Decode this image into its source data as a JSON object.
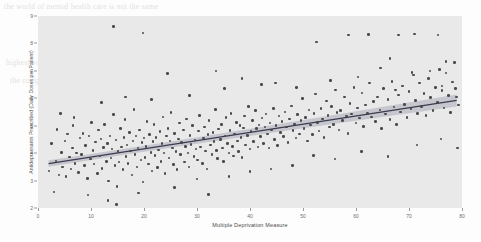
{
  "chart_data": {
    "type": "scatter",
    "title": "",
    "xlabel": "Multiple Deprivation Measure",
    "ylabel": "Antidepressants Prescribed (Daily Doses per Patient)",
    "xlim": [
      0,
      80
    ],
    "ylim": [
      2,
      9
    ],
    "xticks": [
      0,
      10,
      20,
      30,
      40,
      50,
      60,
      70,
      80
    ],
    "yticks": [
      2,
      3,
      4,
      5,
      6,
      7,
      8,
      9
    ],
    "grid": false,
    "legend": null,
    "marker_color": "#4a4a4a",
    "fit_line_color": "#3b3b4f",
    "confidence_band_color": "#b9b9c4",
    "plot_background": "#e9e9e9",
    "fit_line": {
      "type": "linear-regression",
      "x_start": 2.0,
      "y_start": 3.62,
      "x_end": 79.0,
      "y_end": 5.92,
      "slope": 0.0299,
      "intercept": 3.56,
      "confidence_band": {
        "x_start": 2.0,
        "lower_start": 3.5,
        "upper_start": 3.74,
        "x_mid": 26.0,
        "lower_mid": 4.27,
        "upper_mid": 4.42,
        "x_end": 79.0,
        "lower_end": 5.7,
        "upper_end": 6.14
      }
    },
    "points": [
      [
        2.1,
        3.35
      ],
      [
        2.6,
        4.35
      ],
      [
        3.0,
        2.58
      ],
      [
        3.4,
        3.72
      ],
      [
        3.6,
        4.86
      ],
      [
        4.0,
        3.2
      ],
      [
        4.4,
        4.02
      ],
      [
        4.6,
        3.5
      ],
      [
        5.1,
        4.45
      ],
      [
        5.3,
        3.15
      ],
      [
        5.6,
        4.7
      ],
      [
        5.9,
        3.86
      ],
      [
        6.2,
        3.42
      ],
      [
        6.5,
        4.18
      ],
      [
        6.8,
        5.3
      ],
      [
        7.0,
        3.62
      ],
      [
        7.3,
        4.0
      ],
      [
        7.6,
        3.3
      ],
      [
        7.9,
        4.55
      ],
      [
        8.2,
        3.95
      ],
      [
        8.5,
        4.72
      ],
      [
        8.8,
        3.55
      ],
      [
        9.0,
        4.28
      ],
      [
        9.3,
        3.08
      ],
      [
        9.6,
        4.62
      ],
      [
        9.9,
        3.78
      ],
      [
        10.1,
        5.12
      ],
      [
        10.4,
        4.1
      ],
      [
        10.6,
        3.6
      ],
      [
        10.9,
        4.4
      ],
      [
        11.2,
        3.25
      ],
      [
        11.4,
        4.85
      ],
      [
        11.7,
        3.9
      ],
      [
        11.9,
        4.52
      ],
      [
        12.1,
        3.45
      ],
      [
        12.4,
        4.2
      ],
      [
        12.6,
        5.05
      ],
      [
        12.9,
        3.7
      ],
      [
        13.1,
        4.35
      ],
      [
        13.3,
        2.98
      ],
      [
        13.6,
        4.62
      ],
      [
        13.8,
        3.82
      ],
      [
        14.0,
        4.15
      ],
      [
        14.2,
        5.4
      ],
      [
        14.5,
        3.55
      ],
      [
        14.7,
        4.48
      ],
      [
        14.9,
        2.78
      ],
      [
        15.1,
        4.05
      ],
      [
        15.3,
        3.68
      ],
      [
        15.6,
        4.9
      ],
      [
        15.8,
        4.22
      ],
      [
        16.0,
        3.4
      ],
      [
        16.2,
        4.58
      ],
      [
        16.4,
        5.22
      ],
      [
        16.6,
        3.88
      ],
      [
        16.8,
        4.3
      ],
      [
        17.0,
        3.62
      ],
      [
        17.3,
        4.75
      ],
      [
        17.5,
        4.08
      ],
      [
        17.7,
        3.2
      ],
      [
        17.9,
        4.45
      ],
      [
        18.1,
        5.6
      ],
      [
        18.3,
        3.95
      ],
      [
        18.5,
        4.62
      ],
      [
        18.7,
        3.5
      ],
      [
        18.9,
        4.18
      ],
      [
        19.1,
        4.85
      ],
      [
        19.4,
        3.75
      ],
      [
        19.6,
        4.38
      ],
      [
        19.8,
        2.95
      ],
      [
        20.0,
        4.55
      ],
      [
        20.2,
        3.85
      ],
      [
        20.4,
        4.25
      ],
      [
        20.6,
        5.15
      ],
      [
        20.8,
        3.6
      ],
      [
        21.0,
        4.68
      ],
      [
        21.3,
        4.02
      ],
      [
        21.5,
        3.35
      ],
      [
        21.7,
        4.42
      ],
      [
        21.9,
        5.05
      ],
      [
        22.1,
        3.92
      ],
      [
        22.3,
        4.58
      ],
      [
        22.5,
        3.48
      ],
      [
        22.7,
        4.12
      ],
      [
        23.0,
        4.78
      ],
      [
        23.2,
        3.7
      ],
      [
        23.4,
        4.35
      ],
      [
        23.6,
        5.32
      ],
      [
        23.8,
        4.0
      ],
      [
        24.0,
        3.25
      ],
      [
        24.3,
        4.62
      ],
      [
        24.5,
        4.9
      ],
      [
        24.7,
        3.82
      ],
      [
        24.9,
        4.45
      ],
      [
        25.1,
        5.48
      ],
      [
        25.4,
        4.18
      ],
      [
        25.6,
        3.58
      ],
      [
        25.8,
        4.72
      ],
      [
        26.0,
        4.05
      ],
      [
        26.2,
        3.4
      ],
      [
        26.5,
        4.52
      ],
      [
        26.7,
        5.1
      ],
      [
        26.9,
        3.95
      ],
      [
        27.1,
        4.38
      ],
      [
        27.4,
        4.85
      ],
      [
        27.6,
        3.68
      ],
      [
        27.8,
        4.25
      ],
      [
        28.0,
        5.25
      ],
      [
        28.3,
        4.0
      ],
      [
        28.5,
        3.5
      ],
      [
        28.7,
        4.65
      ],
      [
        28.9,
        4.32
      ],
      [
        29.2,
        5.0
      ],
      [
        29.4,
        3.88
      ],
      [
        29.6,
        4.48
      ],
      [
        29.8,
        4.15
      ],
      [
        30.1,
        3.75
      ],
      [
        30.3,
        4.8
      ],
      [
        30.5,
        5.38
      ],
      [
        30.7,
        4.22
      ],
      [
        31.0,
        3.62
      ],
      [
        31.2,
        4.55
      ],
      [
        31.4,
        4.95
      ],
      [
        31.6,
        4.08
      ],
      [
        31.9,
        3.42
      ],
      [
        32.1,
        4.68
      ],
      [
        32.3,
        5.2
      ],
      [
        32.5,
        4.3
      ],
      [
        32.8,
        3.95
      ],
      [
        33.0,
        4.75
      ],
      [
        33.2,
        4.42
      ],
      [
        33.5,
        5.6
      ],
      [
        33.7,
        4.1
      ],
      [
        33.9,
        3.8
      ],
      [
        34.1,
        4.88
      ],
      [
        34.4,
        4.5
      ],
      [
        34.6,
        5.05
      ],
      [
        34.8,
        4.18
      ],
      [
        35.0,
        3.7
      ],
      [
        35.3,
        4.62
      ],
      [
        35.5,
        5.3
      ],
      [
        35.7,
        4.35
      ],
      [
        36.0,
        4.0
      ],
      [
        36.2,
        4.82
      ],
      [
        36.4,
        5.45
      ],
      [
        36.7,
        4.25
      ],
      [
        36.9,
        3.9
      ],
      [
        37.1,
        4.7
      ],
      [
        37.4,
        5.12
      ],
      [
        37.6,
        4.45
      ],
      [
        37.8,
        4.05
      ],
      [
        38.1,
        5.0
      ],
      [
        38.3,
        4.58
      ],
      [
        38.5,
        3.85
      ],
      [
        38.8,
        4.92
      ],
      [
        39.0,
        5.35
      ],
      [
        39.2,
        4.3
      ],
      [
        39.5,
        4.65
      ],
      [
        39.7,
        5.7
      ],
      [
        40.0,
        4.15
      ],
      [
        40.2,
        4.78
      ],
      [
        40.5,
        5.18
      ],
      [
        40.7,
        4.42
      ],
      [
        41.0,
        5.55
      ],
      [
        41.2,
        4.9
      ],
      [
        41.5,
        4.22
      ],
      [
        41.7,
        5.02
      ],
      [
        42.0,
        4.6
      ],
      [
        42.3,
        5.28
      ],
      [
        42.5,
        4.35
      ],
      [
        42.8,
        4.95
      ],
      [
        43.0,
        5.42
      ],
      [
        43.3,
        4.7
      ],
      [
        43.6,
        4.18
      ],
      [
        43.8,
        5.1
      ],
      [
        44.1,
        4.85
      ],
      [
        44.4,
        5.62
      ],
      [
        44.6,
        4.5
      ],
      [
        44.9,
        5.0
      ],
      [
        45.2,
        4.28
      ],
      [
        45.5,
        5.35
      ],
      [
        45.7,
        4.75
      ],
      [
        46.0,
        5.15
      ],
      [
        46.3,
        4.6
      ],
      [
        46.6,
        5.5
      ],
      [
        46.9,
        4.95
      ],
      [
        47.2,
        4.38
      ],
      [
        47.5,
        5.25
      ],
      [
        47.8,
        5.72
      ],
      [
        48.1,
        4.82
      ],
      [
        48.4,
        5.05
      ],
      [
        48.7,
        4.55
      ],
      [
        49.0,
        5.4
      ],
      [
        49.3,
        4.7
      ],
      [
        49.6,
        5.18
      ],
      [
        49.9,
        6.0
      ],
      [
        50.2,
        4.9
      ],
      [
        50.5,
        5.3
      ],
      [
        50.8,
        4.45
      ],
      [
        51.1,
        5.58
      ],
      [
        51.4,
        5.02
      ],
      [
        51.8,
        4.68
      ],
      [
        52.1,
        5.45
      ],
      [
        52.4,
        6.15
      ],
      [
        52.7,
        5.12
      ],
      [
        53.0,
        4.8
      ],
      [
        53.4,
        5.62
      ],
      [
        53.7,
        5.25
      ],
      [
        54.0,
        4.58
      ],
      [
        54.4,
        5.9
      ],
      [
        54.7,
        5.38
      ],
      [
        55.0,
        4.95
      ],
      [
        55.4,
        5.7
      ],
      [
        55.7,
        5.05
      ],
      [
        56.1,
        6.3
      ],
      [
        56.4,
        5.48
      ],
      [
        56.8,
        4.85
      ],
      [
        57.1,
        5.55
      ],
      [
        57.5,
        5.2
      ],
      [
        57.8,
        6.05
      ],
      [
        58.2,
        5.35
      ],
      [
        58.5,
        4.72
      ],
      [
        58.9,
        5.82
      ],
      [
        59.2,
        5.42
      ],
      [
        59.6,
        6.4
      ],
      [
        60.0,
        5.1
      ],
      [
        60.3,
        5.65
      ],
      [
        60.7,
        5.28
      ],
      [
        61.1,
        6.2
      ],
      [
        61.4,
        4.98
      ],
      [
        61.8,
        5.75
      ],
      [
        62.2,
        5.45
      ],
      [
        62.5,
        6.55
      ],
      [
        62.9,
        5.32
      ],
      [
        63.3,
        5.88
      ],
      [
        63.7,
        5.15
      ],
      [
        64.1,
        6.05
      ],
      [
        64.5,
        5.58
      ],
      [
        64.8,
        4.9
      ],
      [
        65.2,
        6.35
      ],
      [
        65.6,
        5.42
      ],
      [
        66.0,
        5.95
      ],
      [
        66.4,
        5.22
      ],
      [
        66.8,
        6.62
      ],
      [
        67.2,
        5.68
      ],
      [
        67.6,
        5.05
      ],
      [
        68.0,
        6.12
      ],
      [
        68.4,
        5.5
      ],
      [
        68.8,
        6.45
      ],
      [
        69.2,
        5.78
      ],
      [
        69.6,
        5.3
      ],
      [
        70.0,
        6.25
      ],
      [
        70.4,
        5.62
      ],
      [
        70.8,
        6.85
      ],
      [
        71.2,
        5.92
      ],
      [
        71.6,
        5.45
      ],
      [
        72.0,
        6.55
      ],
      [
        72.4,
        5.7
      ],
      [
        72.8,
        6.18
      ],
      [
        73.2,
        5.38
      ],
      [
        73.7,
        6.72
      ],
      [
        74.1,
        6.02
      ],
      [
        74.5,
        5.55
      ],
      [
        75.0,
        6.4
      ],
      [
        75.4,
        5.85
      ],
      [
        75.8,
        7.05
      ],
      [
        76.2,
        6.28
      ],
      [
        76.6,
        5.65
      ],
      [
        77.0,
        6.92
      ],
      [
        77.4,
        6.1
      ],
      [
        77.8,
        5.48
      ],
      [
        78.2,
        6.6
      ],
      [
        78.6,
        7.3
      ],
      [
        79.0,
        6.05
      ],
      [
        79.3,
        5.75
      ],
      [
        14.3,
        8.62
      ],
      [
        19.8,
        8.38
      ],
      [
        24.4,
        6.9
      ],
      [
        33.6,
        7.0
      ],
      [
        38.5,
        6.72
      ],
      [
        44.8,
        6.55
      ],
      [
        52.6,
        8.05
      ],
      [
        58.6,
        8.3
      ],
      [
        62.4,
        8.32
      ],
      [
        68.0,
        8.3
      ],
      [
        71.0,
        8.35
      ],
      [
        75.5,
        8.3
      ],
      [
        77.0,
        7.35
      ],
      [
        64.6,
        7.1
      ],
      [
        66.4,
        7.45
      ],
      [
        70.6,
        6.95
      ],
      [
        74.0,
        7.0
      ],
      [
        76.2,
        6.45
      ],
      [
        78.8,
        6.35
      ],
      [
        9.4,
        2.48
      ],
      [
        13.2,
        2.28
      ],
      [
        14.8,
        2.12
      ],
      [
        19.0,
        2.55
      ],
      [
        25.8,
        2.75
      ],
      [
        32.2,
        2.5
      ],
      [
        4.2,
        5.45
      ],
      [
        6.6,
        5.0
      ],
      [
        12.0,
        5.85
      ],
      [
        16.5,
        6.05
      ],
      [
        21.4,
        5.95
      ],
      [
        28.6,
        6.1
      ],
      [
        35.2,
        6.35
      ],
      [
        42.2,
        6.5
      ],
      [
        48.8,
        6.4
      ],
      [
        55.2,
        6.65
      ],
      [
        60.4,
        6.78
      ],
      [
        67.4,
        6.3
      ],
      [
        48.0,
        3.55
      ],
      [
        52.0,
        3.92
      ],
      [
        56.0,
        3.78
      ],
      [
        61.0,
        4.05
      ],
      [
        66.0,
        3.88
      ],
      [
        71.5,
        4.3
      ],
      [
        76.0,
        4.52
      ],
      [
        79.2,
        4.18
      ],
      [
        44.0,
        3.42
      ],
      [
        40.0,
        3.32
      ],
      [
        36.0,
        3.15
      ],
      [
        30.0,
        3.05
      ]
    ]
  }
}
